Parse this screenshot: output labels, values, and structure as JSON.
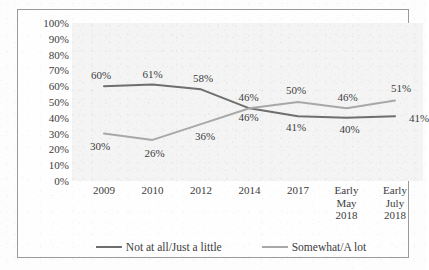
{
  "chart_data": {
    "type": "line",
    "title": "",
    "xlabel": "",
    "ylabel": "",
    "ylim": [
      0,
      100
    ],
    "grid": false,
    "legend_position": "bottom",
    "categories": [
      "2009",
      "2010",
      "2012",
      "2014",
      "2017",
      "Early\nMay\n2018",
      "Early\nJuly\n2018"
    ],
    "ytick_labels": [
      "100%",
      "90%",
      "80%",
      "70%",
      "60%",
      "50%",
      "40%",
      "30%",
      "20%",
      "10%",
      "0%"
    ],
    "ytick_values": [
      100,
      90,
      80,
      70,
      60,
      50,
      40,
      30,
      20,
      10,
      0
    ],
    "series": [
      {
        "name": "Not at all/Just a little",
        "color": "#6e6e6e",
        "values": [
          60,
          61,
          58,
          46,
          41,
          40,
          41
        ],
        "point_labels": [
          "60%",
          "61%",
          "58%",
          "46%",
          "41%",
          "40%",
          "41%"
        ]
      },
      {
        "name": "Somewhat/A lot",
        "color": "#a8a8a8",
        "values": [
          30,
          26,
          36,
          46,
          50,
          46,
          51
        ],
        "point_labels": [
          "30%",
          "26%",
          "36%",
          "46%",
          "50%",
          "46%",
          "51%"
        ]
      }
    ]
  },
  "colors": {
    "series_dark": "#6e6e6e",
    "series_light": "#a8a8a8",
    "plot_background": "#f4f4f4",
    "frame_border": "#9a9a9a",
    "text": "#3c3c3c"
  }
}
